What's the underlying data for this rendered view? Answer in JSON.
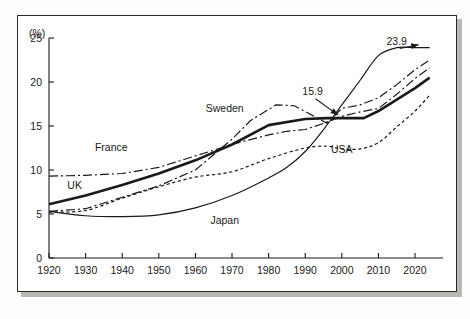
{
  "figure": {
    "unit_label": "(%)",
    "frame_color": "#2b2b2b",
    "line_color": "#1a1a1a"
  },
  "chart_data": {
    "type": "line",
    "title": "",
    "subtitle": "",
    "xlabel": "",
    "ylabel": "(%)",
    "xlim": [
      1920,
      2026
    ],
    "ylim": [
      0,
      25
    ],
    "grid": false,
    "legend_position": "inline-labels",
    "x_ticks": [
      1920,
      1930,
      1940,
      1950,
      1960,
      1970,
      1980,
      1990,
      2000,
      2010,
      2020
    ],
    "x_tick_labels": [
      "1920",
      "1930",
      "1940",
      "1950",
      "1960",
      "1970",
      "1980",
      "1990",
      "2000",
      "2010",
      "2020"
    ],
    "y_ticks": [
      0,
      5,
      10,
      15,
      20,
      25
    ],
    "y_tick_labels": [
      "0",
      "5",
      "10",
      "15",
      "20",
      "25"
    ],
    "series": [
      {
        "name": "France",
        "label": "France",
        "style": "dash-dot",
        "label_x": 1937,
        "label_y": 12.6,
        "x": [
          1920,
          1930,
          1940,
          1950,
          1960,
          1970,
          1980,
          1985,
          1990,
          1995,
          2000,
          2005,
          2010,
          2015,
          2020,
          2024
        ],
        "values": [
          9.3,
          9.4,
          9.6,
          10.3,
          11.6,
          12.9,
          14.0,
          14.4,
          14.6,
          15.3,
          16.1,
          16.6,
          17.0,
          18.6,
          20.4,
          21.6
        ]
      },
      {
        "name": "Sweden",
        "label": "Sweden",
        "style": "dash-dot",
        "label_x": 1968,
        "label_y": 17.0,
        "x": [
          1920,
          1930,
          1940,
          1950,
          1960,
          1970,
          1975,
          1982,
          1987,
          1992,
          1996,
          2000,
          2005,
          2010,
          2015,
          2020,
          2024
        ],
        "values": [
          5.3,
          5.6,
          6.9,
          8.2,
          10.0,
          13.5,
          15.6,
          17.4,
          17.3,
          16.2,
          15.3,
          17.0,
          17.4,
          18.2,
          19.7,
          21.4,
          22.5
        ]
      },
      {
        "name": "UK",
        "label": "UK",
        "style": "thick-solid",
        "label_x": 1927,
        "label_y": 8.2,
        "x": [
          1920,
          1930,
          1940,
          1950,
          1960,
          1970,
          1980,
          1990,
          1996,
          2000,
          2006,
          2010,
          2015,
          2020,
          2024
        ],
        "values": [
          6.1,
          7.1,
          8.3,
          9.6,
          11.1,
          12.9,
          15.1,
          15.8,
          15.9,
          15.9,
          15.9,
          16.7,
          18.0,
          19.3,
          20.5
        ]
      },
      {
        "name": "USA",
        "label": "USA",
        "style": "dotted",
        "label_x": 2000,
        "label_y": 12.3,
        "x": [
          1920,
          1930,
          1940,
          1950,
          1960,
          1970,
          1980,
          1990,
          1996,
          2000,
          2005,
          2010,
          2015,
          2020,
          2024
        ],
        "values": [
          5.2,
          5.4,
          6.8,
          8.1,
          9.2,
          9.8,
          11.3,
          12.5,
          12.7,
          12.4,
          12.4,
          13.1,
          14.9,
          16.7,
          18.5
        ]
      },
      {
        "name": "Japan",
        "label": "Japan",
        "style": "thin-solid",
        "label_x": 1968,
        "label_y": 4.3,
        "x": [
          1920,
          1930,
          1940,
          1950,
          1960,
          1970,
          1980,
          1985,
          1990,
          1995,
          2000,
          2005,
          2010,
          2015,
          2020,
          2024
        ],
        "values": [
          5.3,
          4.8,
          4.7,
          4.9,
          5.7,
          7.1,
          9.1,
          10.3,
          12.1,
          14.6,
          17.4,
          20.2,
          23.0,
          23.9,
          23.9,
          23.9
        ]
      }
    ],
    "annotations": [
      {
        "text": "23.9",
        "value": 23.9,
        "series": "Japan",
        "label_x": 2015,
        "label_y": 24.6,
        "target_x": 2021,
        "target_y": 23.9
      },
      {
        "text": "15.9",
        "value": 15.9,
        "series": "UK",
        "label_x": 1992,
        "label_y": 18.9,
        "target_x": 1999,
        "target_y": 15.9
      }
    ]
  }
}
